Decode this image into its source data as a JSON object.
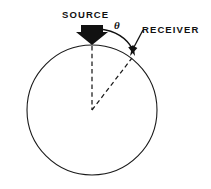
{
  "figure": {
    "title_present": false,
    "background_color": "#ffffff",
    "ink_color": "#111111",
    "labels": {
      "source": "SOURCE",
      "receiver": "RECEIVER",
      "angle": "θ"
    },
    "elements": {
      "circle_name": "circle-outline",
      "source_arrow_name": "source-arrow",
      "radius_dashed_vertical_name": "dashed-radius-vertical",
      "radius_dashed_angled_name": "dashed-radius-to-receiver",
      "angle_arc_name": "angle-arc",
      "receiver_pointer_name": "receiver-pointer"
    },
    "geometry": {
      "circle_center_x": 92,
      "circle_center_y": 110,
      "circle_radius": 65,
      "source_point_x": 92,
      "source_point_y": 45,
      "receiver_point_x": 131,
      "receiver_point_y": 58
    }
  }
}
